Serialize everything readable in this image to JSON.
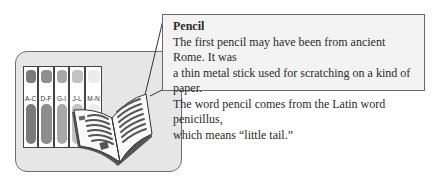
{
  "callout": {
    "title": "Pencil",
    "lines": [
      "The first pencil may have been from ancient Rome. It was",
      "a thin metal stick used for scratching on a kind of paper.",
      "The word pencil comes from the Latin word penicillus,",
      "which means “little tail.”"
    ]
  },
  "encyclopedia": {
    "volumes": [
      {
        "label": "A-C",
        "color": "#7a7a7a"
      },
      {
        "label": "D-F",
        "color": "#8e8e8e"
      },
      {
        "label": "G-I",
        "color": "#a8a8a8"
      },
      {
        "label": "J-L",
        "color": "#c2c2c2"
      },
      {
        "label": "M-N",
        "color": "#e2e2e2"
      }
    ]
  },
  "colors": {
    "panel": "#e6e6e6",
    "callout_bg": "#f3f3f3",
    "border": "#6a6a6a"
  }
}
